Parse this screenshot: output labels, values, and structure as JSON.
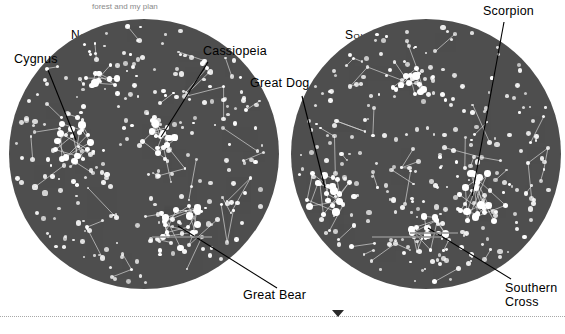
{
  "page": {
    "top_note": "forest and my plan",
    "background_color": "#ffffff",
    "sky_color": "#4e4e4e",
    "star_color": "#ffffff",
    "leader_color": "#000000"
  },
  "hemispheres": [
    {
      "id": "northern",
      "title": "Northern Hemisphere"
    },
    {
      "id": "southern",
      "title": "Southern Hemisphere"
    }
  ],
  "labels": [
    {
      "id": "cygnus",
      "text": "Cygnus"
    },
    {
      "id": "cassiopeia",
      "text": "Cassiopeia"
    },
    {
      "id": "great-bear",
      "text": "Great Bear"
    },
    {
      "id": "great-dog",
      "text": "Great Dog"
    },
    {
      "id": "scorpion",
      "text": "Scorpion"
    },
    {
      "id": "southern-cross-line1",
      "text": "Southern"
    },
    {
      "id": "southern-cross-line2",
      "text": "Cross"
    }
  ],
  "chart_data": {
    "type": "scatter",
    "panels": [
      {
        "name": "Northern Hemisphere",
        "center": [
          144,
          154
        ],
        "radius": 135,
        "constellations": [
          "Cygnus",
          "Cassiopeia",
          "Great Bear"
        ]
      },
      {
        "name": "Southern Hemisphere",
        "center": [
          426,
          154
        ],
        "radius": 135,
        "constellations": [
          "Great Dog",
          "Scorpion",
          "Southern Cross"
        ]
      }
    ]
  }
}
